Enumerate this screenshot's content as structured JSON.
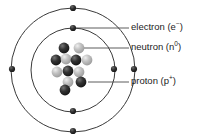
{
  "diagram": {
    "type": "atomic-structure-diagram",
    "colors": {
      "stroke": "#3a3a3a",
      "electron": "#2b2b2b",
      "proton_dark": "#2e2e2e",
      "neutron_light": "#b4b4b4",
      "text": "#1c1c1c",
      "background": "#ffffff"
    },
    "center": {
      "x": 73,
      "y": 70
    },
    "shells": [
      {
        "name": "outer-shell",
        "radius": 62,
        "electron_count": 4
      },
      {
        "name": "inner-shell",
        "radius": 42,
        "electron_count": 4
      }
    ],
    "electrons": [
      {
        "shell": "outer",
        "position": "top",
        "x": 73,
        "y": 8
      },
      {
        "shell": "outer",
        "position": "left",
        "x": 12,
        "y": 69
      },
      {
        "shell": "outer",
        "position": "bottom",
        "x": 73,
        "y": 131
      },
      {
        "shell": "outer",
        "position": "right",
        "x": 134,
        "y": 69
      },
      {
        "shell": "inner",
        "position": "top",
        "x": 73,
        "y": 28
      },
      {
        "shell": "inner",
        "position": "bottom",
        "x": 73,
        "y": 111
      },
      {
        "shell": "inner",
        "position": "right",
        "x": 114,
        "y": 69
      }
    ],
    "nucleus": {
      "particle_radius": 5.4,
      "particles": [
        {
          "kind": "proton",
          "x": 64,
          "y": 48
        },
        {
          "kind": "neutron",
          "x": 79,
          "y": 48
        },
        {
          "kind": "proton",
          "x": 56,
          "y": 60
        },
        {
          "kind": "neutron",
          "x": 66,
          "y": 59
        },
        {
          "kind": "proton",
          "x": 76,
          "y": 60
        },
        {
          "kind": "neutron",
          "x": 87,
          "y": 60
        },
        {
          "kind": "neutron",
          "x": 57,
          "y": 72
        },
        {
          "kind": "proton",
          "x": 68,
          "y": 71
        },
        {
          "kind": "neutron",
          "x": 79,
          "y": 72
        },
        {
          "kind": "neutron",
          "x": 68,
          "y": 82
        },
        {
          "kind": "proton",
          "x": 81,
          "y": 82
        },
        {
          "kind": "proton",
          "x": 65,
          "y": 90
        }
      ]
    },
    "leaders": [
      {
        "name": "electron-leader",
        "points": "73,28 129,28"
      },
      {
        "name": "neutron-leader",
        "points": "81,48 129,48"
      },
      {
        "name": "proton-leader",
        "points": "88,82 129,82"
      }
    ],
    "labels": [
      {
        "id": "electron",
        "text": "electron (e",
        "sup": "−",
        "tail": ")",
        "x": 131,
        "y": 23
      },
      {
        "id": "neutron",
        "text": "neutron (n",
        "sup": "0",
        "tail": ")",
        "x": 131,
        "y": 43
      },
      {
        "id": "proton",
        "text": "proton (p",
        "sup": "+",
        "tail": ")",
        "x": 131,
        "y": 77
      }
    ]
  }
}
